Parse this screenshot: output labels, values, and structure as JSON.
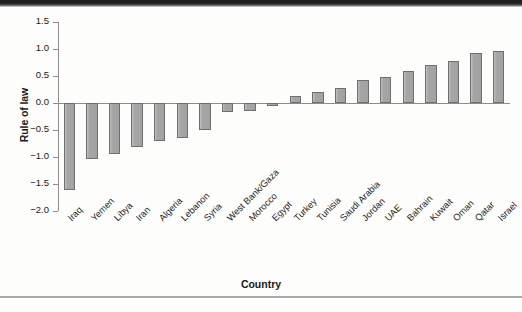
{
  "chart_data": {
    "type": "bar",
    "title": "",
    "subtitle": "",
    "xlabel": "Country",
    "ylabel": "Rule of law",
    "ylim": [
      -2.0,
      1.5
    ],
    "yticks": [
      "1.5",
      "1.0",
      "0.5",
      "0.0",
      "-0.5",
      "-1.0",
      "-1.5",
      "-2.0"
    ],
    "ytick_values": [
      1.5,
      1.0,
      0.5,
      0.0,
      -0.5,
      -1.0,
      -1.5,
      -2.0
    ],
    "grid": false,
    "legend": null,
    "legend_position": "none",
    "bar_fill_color": "#a9a9a9",
    "bar_edge_color": "#6f6f6f",
    "axis_color": "#8c8c8c",
    "categories": [
      "Iraq",
      "Yemen",
      "Libya",
      "Iran",
      "Algeria",
      "Lebanon",
      "Syria",
      "West Bank/Gaza",
      "Morocco",
      "Egypt",
      "Turkey",
      "Tunisia",
      "Saudi Arabia",
      "Jordan",
      "UAE",
      "Bahrain",
      "Kuwait",
      "Oman",
      "Qatar",
      "Israel"
    ],
    "values": [
      -1.62,
      -1.03,
      -0.95,
      -0.82,
      -0.7,
      -0.65,
      -0.5,
      -0.17,
      -0.15,
      -0.05,
      0.13,
      0.2,
      0.27,
      0.42,
      0.48,
      0.6,
      0.7,
      0.77,
      0.92,
      0.97
    ]
  }
}
